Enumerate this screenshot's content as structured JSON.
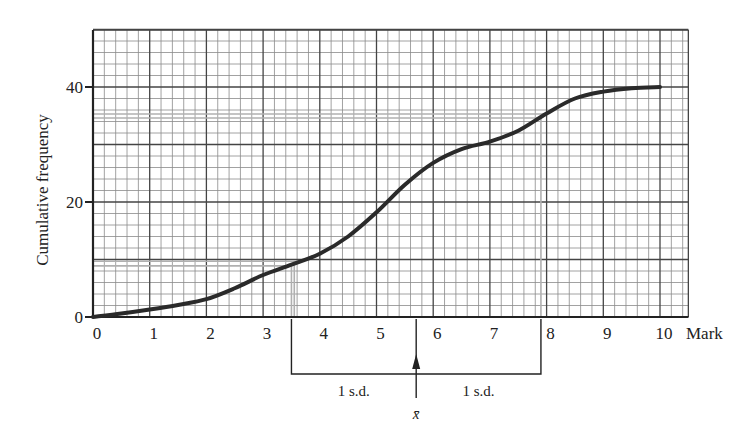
{
  "chart_data": {
    "type": "line",
    "title": "",
    "xlabel": "Mark",
    "ylabel": "Cumulative frequency",
    "xlim": [
      0,
      10.5
    ],
    "ylim": [
      0,
      47
    ],
    "grid": true,
    "x_ticks": [
      0,
      1,
      2,
      3,
      4,
      5,
      6,
      7,
      8,
      9,
      10
    ],
    "y_ticks": [
      0,
      20,
      40
    ],
    "series": [
      {
        "name": "Cumulative frequency curve",
        "x": [
          0,
          0.5,
          1,
          1.5,
          2,
          2.5,
          3,
          3.5,
          4,
          4.5,
          5,
          5.5,
          6,
          6.5,
          7,
          7.5,
          8,
          8.5,
          9,
          9.5,
          10
        ],
        "y": [
          0,
          0.6,
          1.3,
          2.1,
          3.1,
          5.0,
          7.3,
          9.1,
          11.0,
          14.0,
          18.2,
          23.0,
          26.8,
          29.2,
          30.5,
          32.4,
          35.4,
          38.0,
          39.2,
          39.8,
          40
        ]
      }
    ],
    "reference_lines": {
      "horizontal": [
        8.9,
        9.7,
        34.6,
        35.3
      ],
      "vertical": [
        3.5,
        3.55,
        7.9
      ]
    },
    "annotations": {
      "mean_label": "x̄",
      "mean_x": 5.7,
      "sd_left_label": "1 s.d.",
      "sd_right_label": "1 s.d.",
      "bracket_from": 3.5,
      "bracket_to": 7.9
    }
  }
}
